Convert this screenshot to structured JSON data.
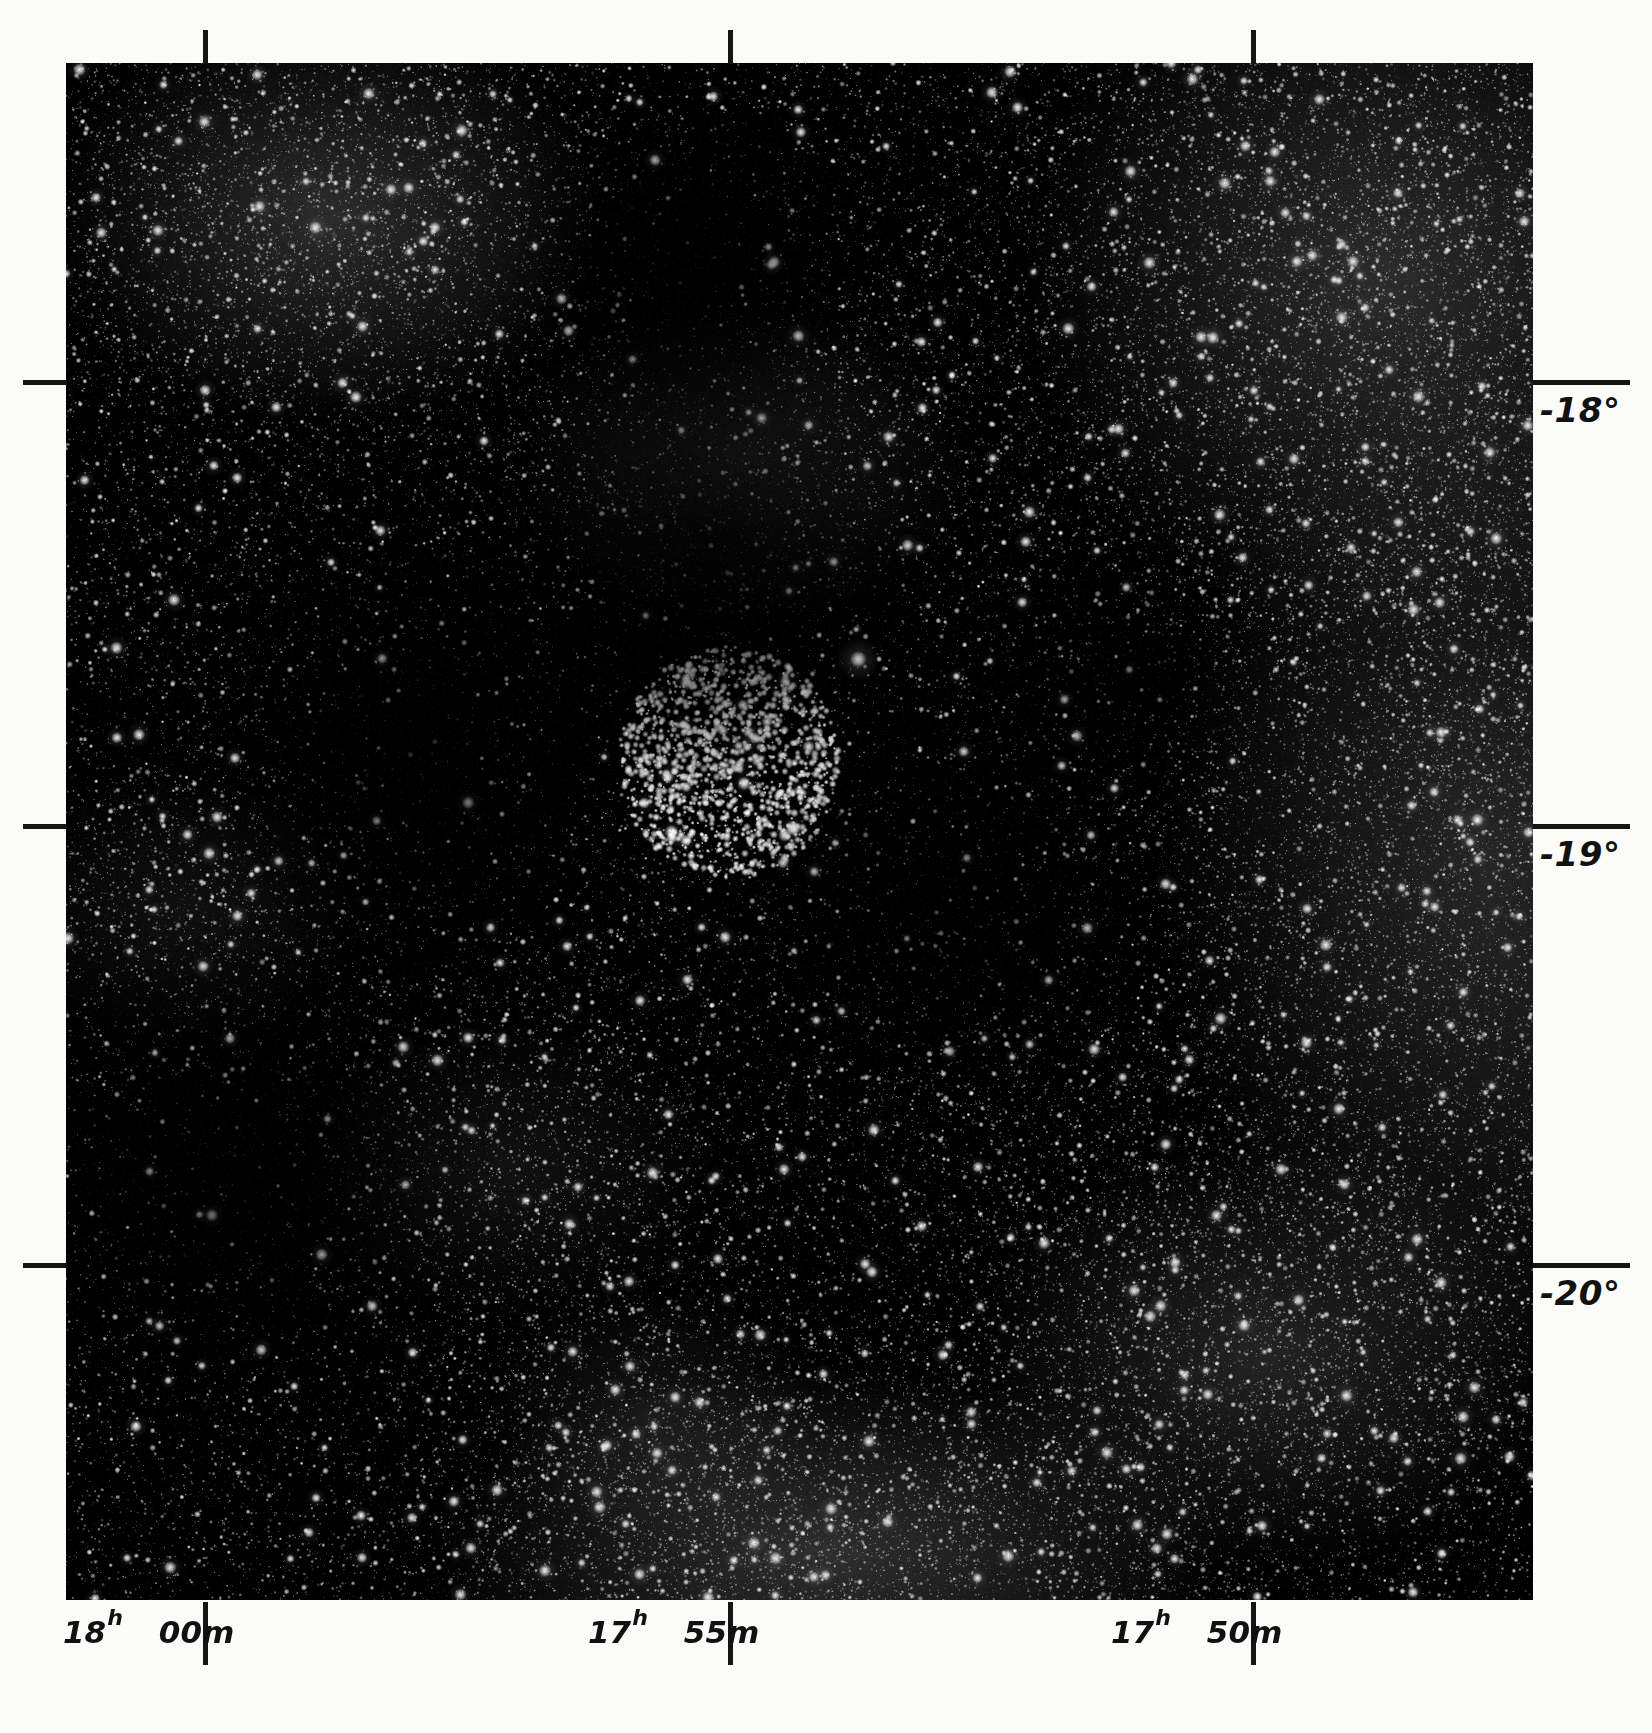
{
  "figure": {
    "kind": "astronomical-photographic-plate",
    "plate": {
      "left": 66,
      "top": 63,
      "width": 1467,
      "height": 1537,
      "background_color": "#000000",
      "page_color": "#fbfbf9",
      "ink_color": "#111111"
    }
  },
  "axes": {
    "x_axis": {
      "name": "right-ascension",
      "unit_major": "h",
      "unit_minor": "m",
      "direction": "increasing right-to-left",
      "ticks": [
        {
          "hours": "18",
          "h_unit": "h",
          "minutes": "00",
          "m_unit": "m",
          "x": 205
        },
        {
          "hours": "17",
          "h_unit": "h",
          "minutes": "55",
          "m_unit": "m",
          "x": 730
        },
        {
          "hours": "17",
          "h_unit": "h",
          "minutes": "50",
          "m_unit": "m",
          "x": 1253
        }
      ]
    },
    "y_axis": {
      "name": "declination",
      "unit": "degrees",
      "ticks": [
        {
          "label": "-18°",
          "y": 382
        },
        {
          "label": "-19°",
          "y": 826
        },
        {
          "label": "-20°",
          "y": 1265
        }
      ]
    }
  },
  "chart_data": {
    "type": "scatter",
    "title": "",
    "xlabel": "Right Ascension",
    "ylabel": "Declination",
    "xticklabels": [
      "18h 00m",
      "17h 55m",
      "17h 50m"
    ],
    "yticklabels": [
      "-18°",
      "-19°",
      "-20°"
    ],
    "xlim": [
      "18h 02m",
      "17h 47m"
    ],
    "ylim": [
      "-20.5",
      "-17.3"
    ],
    "grid": false,
    "legend": null,
    "features": [
      {
        "name": "open-star-cluster",
        "x_frac": 0.452,
        "y_frac": 0.455,
        "radius_frac": 0.075,
        "star_count": 140
      },
      {
        "name": "bright-field-star",
        "x_frac": 0.54,
        "y_frac": 0.388,
        "magnitude": "bright"
      },
      {
        "name": "dark-nebula-lane",
        "x_frac": 0.42,
        "y_frac": 0.22
      },
      {
        "name": "milky-way-star-cloud",
        "x_frac": 0.92,
        "y_frac": 0.4
      }
    ]
  }
}
